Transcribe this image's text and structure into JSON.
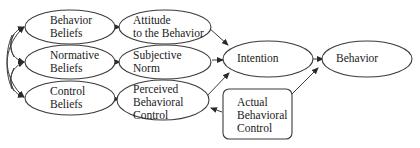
{
  "diagram": {
    "type": "flow-diagram",
    "nodes": {
      "behavior_beliefs": {
        "line1": "Behavior",
        "line2": "Beliefs"
      },
      "normative_beliefs": {
        "line1": "Normative",
        "line2": "Beliefs"
      },
      "control_beliefs": {
        "line1": "Control",
        "line2": "Beliefs"
      },
      "attitude": {
        "line1": "Attitude",
        "line2": "to the Behavior"
      },
      "subjective_norm": {
        "line1": "Subjective",
        "line2": "Norm"
      },
      "perceived_control": {
        "line1": "Perceived",
        "line2": "Behavioral",
        "line3": "Control"
      },
      "intention": {
        "line1": "Intention"
      },
      "behavior": {
        "line1": "Behavior"
      },
      "actual_control": {
        "line1": "Actual",
        "line2": "Behavioral",
        "line3": "Control"
      }
    },
    "edges": [
      {
        "from": "Behavior Beliefs",
        "to": "Attitude to the Behavior"
      },
      {
        "from": "Normative Beliefs",
        "to": "Subjective Norm"
      },
      {
        "from": "Control Beliefs",
        "to": "Perceived Behavioral Control"
      },
      {
        "from": "Attitude to the Behavior",
        "to": "Intention"
      },
      {
        "from": "Subjective Norm",
        "to": "Intention"
      },
      {
        "from": "Perceived Behavioral Control",
        "to": "Intention"
      },
      {
        "from": "Intention",
        "to": "Behavior"
      },
      {
        "from": "Actual Behavioral Control",
        "to": "Perceived Behavioral Control"
      },
      {
        "from": "Actual Behavioral Control",
        "to": "Behavior"
      },
      {
        "from": "Behavior Beliefs",
        "to": "Normative Beliefs",
        "bidirectional": true
      },
      {
        "from": "Normative Beliefs",
        "to": "Control Beliefs",
        "bidirectional": true
      },
      {
        "from": "Behavior Beliefs",
        "to": "Control Beliefs",
        "bidirectional": true
      }
    ],
    "colors": {
      "stroke": "#3a3a3a",
      "fill": "#ffffff",
      "text": "#1a1a1a"
    }
  }
}
